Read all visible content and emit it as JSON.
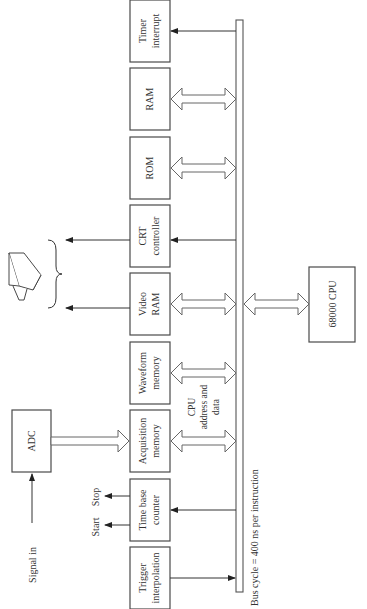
{
  "diagram": {
    "type": "block-diagram",
    "orientation": "rotated-90-ccw",
    "bus": {
      "name": "CPU address and data bus",
      "label_lines": [
        "CPU",
        "address and",
        "data"
      ],
      "caption": "Bus cycle = 400 ns per instruction"
    },
    "blocks": [
      {
        "id": "timer-interrupt",
        "lines": [
          "Timer",
          "interrupt"
        ],
        "connection": "arrow-from-bus"
      },
      {
        "id": "ram",
        "lines": [
          "RAM"
        ],
        "connection": "bidirectional"
      },
      {
        "id": "rom",
        "lines": [
          "ROM"
        ],
        "connection": "bidirectional"
      },
      {
        "id": "crt-controller",
        "lines": [
          "CRT",
          "controller"
        ],
        "connection": "arrow-from-bus"
      },
      {
        "id": "video-ram",
        "lines": [
          "Video",
          "RAM"
        ],
        "connection": "bidirectional"
      },
      {
        "id": "waveform-memory",
        "lines": [
          "Waveform",
          "memory"
        ],
        "connection": "bidirectional"
      },
      {
        "id": "acquisition-memory",
        "lines": [
          "Acquisition",
          "memory"
        ],
        "connection": "bidirectional"
      },
      {
        "id": "time-base-counter",
        "lines": [
          "Time base",
          "counter"
        ],
        "connection": "arrow-from-bus"
      },
      {
        "id": "trigger-interpolation",
        "lines": [
          "Trigger",
          "interpolation"
        ],
        "connection": "arrow-to-bus"
      }
    ],
    "adc": {
      "label": "ADC",
      "input_label": "Signal in",
      "output_to": "acquisition-memory"
    },
    "cpu": {
      "label": "68000 CPU",
      "connection": "bidirectional"
    },
    "time_base_outputs": [
      "Start",
      "Stop"
    ],
    "display": {
      "icon": "crt-monitor",
      "fed_by": [
        "crt-controller",
        "video-ram"
      ]
    }
  }
}
